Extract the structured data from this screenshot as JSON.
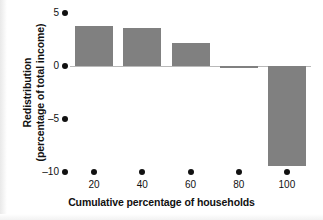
{
  "chart_data": {
    "type": "bar",
    "title": "",
    "xlabel": "Cumulative percentage of households",
    "ylabel_line1": "Redistribution",
    "ylabel_line2": "(percentage of total income)",
    "categories": [
      "20",
      "40",
      "60",
      "80",
      "100"
    ],
    "values": [
      3.8,
      3.6,
      2.2,
      -0.15,
      -9.4
    ],
    "series": [
      {
        "name": "Redistribution",
        "values": [
          3.8,
          3.6,
          2.2,
          -0.15,
          -9.4
        ]
      }
    ],
    "ylim": [
      -10,
      5
    ],
    "xlim": [
      10,
      110
    ],
    "yticks": [
      "5",
      "0",
      "-5",
      "-10"
    ],
    "ytick_values": [
      5,
      0,
      -5,
      -10
    ],
    "xticks": [
      "20",
      "40",
      "60",
      "80",
      "100"
    ],
    "xtick_values": [
      20,
      40,
      60,
      80,
      100
    ],
    "grid": false,
    "legend": false,
    "legend_position": "none",
    "bar_color": "#808080",
    "axis_color": "#111111",
    "zeroline_color": "#b9b9b9",
    "background_color": "#ffffff",
    "tick_marker_style": "filled-circle",
    "annotations": []
  }
}
